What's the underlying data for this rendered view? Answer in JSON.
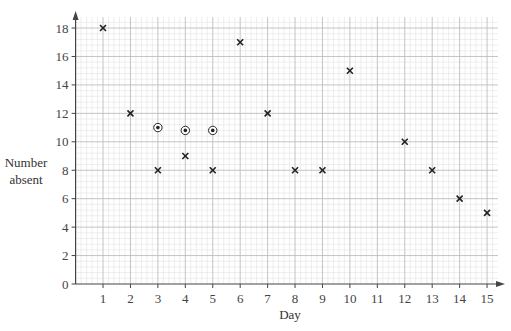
{
  "chart_data": {
    "type": "scatter",
    "title": "",
    "xlabel": "Day",
    "ylabel": "Number absent",
    "ylabel_lines": [
      "Number",
      "absent"
    ],
    "x_ticks": [
      1,
      2,
      3,
      4,
      5,
      6,
      7,
      8,
      9,
      10,
      11,
      12,
      13,
      14,
      15
    ],
    "y_ticks": [
      0,
      2,
      4,
      6,
      8,
      10,
      12,
      14,
      16,
      18
    ],
    "xlim": [
      0,
      15.5
    ],
    "ylim": [
      0,
      19
    ],
    "grid": true,
    "legend": null,
    "series": [
      {
        "name": "crosses",
        "marker": "x",
        "points": [
          {
            "x": 1,
            "y": 18
          },
          {
            "x": 2,
            "y": 12
          },
          {
            "x": 3,
            "y": 8
          },
          {
            "x": 4,
            "y": 9
          },
          {
            "x": 5,
            "y": 8
          },
          {
            "x": 6,
            "y": 17
          },
          {
            "x": 7,
            "y": 12
          },
          {
            "x": 8,
            "y": 8
          },
          {
            "x": 9,
            "y": 8
          },
          {
            "x": 10,
            "y": 15
          },
          {
            "x": 12,
            "y": 10
          },
          {
            "x": 13,
            "y": 8
          },
          {
            "x": 14,
            "y": 6
          },
          {
            "x": 15,
            "y": 5
          }
        ]
      },
      {
        "name": "circled-dots",
        "marker": "circled-dot",
        "points": [
          {
            "x": 3,
            "y": 11
          },
          {
            "x": 4,
            "y": 10.8
          },
          {
            "x": 5,
            "y": 10.8
          }
        ]
      }
    ]
  },
  "colors": {
    "axis": "#444444",
    "minor_grid": "#e2e2e2",
    "major_grid": "#bdbdbd",
    "marker": "#222222"
  }
}
